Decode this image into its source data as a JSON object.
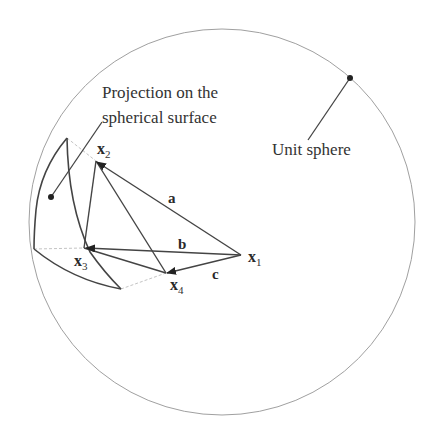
{
  "figure": {
    "type": "geometric-diagram",
    "sphere_label": "Unit sphere",
    "projection_label_line1": "Projection on the",
    "projection_label_line2": "spherical surface",
    "points": {
      "x1": {
        "base": "x",
        "sub": "1"
      },
      "x2": {
        "base": "x",
        "sub": "2"
      },
      "x3": {
        "base": "x",
        "sub": "3"
      },
      "x4": {
        "base": "x",
        "sub": "4"
      }
    },
    "vectors": {
      "a": "a",
      "b": "b",
      "c": "c"
    },
    "colors": {
      "circle": "#9a9a9a",
      "lines": "#444444",
      "dashed": "#bbbbbb",
      "text": "#333333"
    }
  }
}
